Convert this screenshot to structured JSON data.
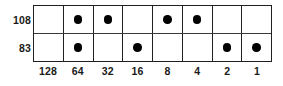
{
  "figure": {
    "colors": {
      "background": "#ffffff",
      "border": "#231f20",
      "divider": "#3a3a3a",
      "dot": "#000000",
      "text": "#1a1a1a"
    },
    "column_headers": [
      "128",
      "64",
      "32",
      "16",
      "8",
      "4",
      "2",
      "1"
    ],
    "rows": [
      {
        "label": "108",
        "bits": [
          0,
          1,
          1,
          0,
          1,
          1,
          0,
          0
        ]
      },
      {
        "label": "83",
        "bits": [
          0,
          1,
          0,
          1,
          0,
          0,
          1,
          1
        ]
      }
    ]
  },
  "chart_data": {
    "type": "table",
    "title": "",
    "xlabel": "",
    "ylabel": "",
    "categories": [
      "128",
      "64",
      "32",
      "16",
      "8",
      "4",
      "2",
      "1"
    ],
    "series": [
      {
        "name": "108",
        "values": [
          0,
          1,
          1,
          0,
          1,
          1,
          0,
          0
        ]
      },
      {
        "name": "83",
        "values": [
          0,
          1,
          0,
          1,
          0,
          0,
          1,
          1
        ]
      }
    ],
    "notes": [
      "Binary place-value table: a filled dot marks that the place value is included in the sum.",
      "108 = 64 + 32 + 8 + 4",
      "83 = 64 + 16 + 2 + 1"
    ],
    "grid": true,
    "legend": "none"
  }
}
